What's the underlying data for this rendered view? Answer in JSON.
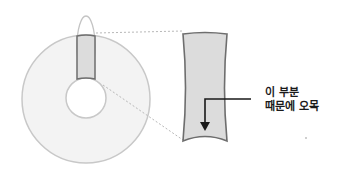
{
  "diagram": {
    "annotation": {
      "line1": "이 부분",
      "line2": "때문에 오목"
    },
    "colors": {
      "ring_fill": "#f3f3f3",
      "ring_stroke": "#c8c8c8",
      "highlight_fill": "#dcdcdc",
      "highlight_stroke": "#6e6e6e",
      "ellipse_stroke": "#c4c4c4",
      "dotted_line": "#b8b8b8",
      "arrow": "#1a1a1a",
      "text": "#1a1a1a"
    },
    "shapes": {
      "outer_circle": {
        "cx": 86,
        "cy": 99,
        "r": 64
      },
      "inner_circle": {
        "cx": 86,
        "cy": 98,
        "r": 20
      },
      "ellipse": {
        "cx": 86,
        "cy": 46,
        "rx": 9,
        "ry": 30
      },
      "magnified_section": {
        "x1": 181,
        "y1": 32,
        "x2": 228,
        "y2": 143
      }
    }
  }
}
